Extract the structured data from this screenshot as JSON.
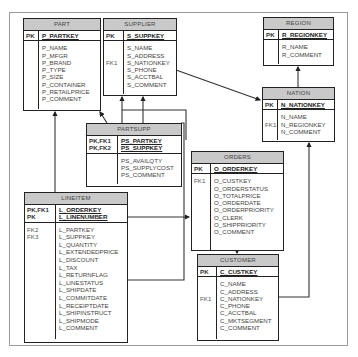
{
  "tables": {
    "part": {
      "title": "PART",
      "pk_labels": [
        "PK"
      ],
      "pk_fields": [
        "P_PARTKEY"
      ],
      "fk_labels": [],
      "fields": [
        "P_NAME",
        "P_MFGR",
        "P_BRAND",
        "P_TYPE",
        "P_SIZE",
        "P_CONTAINER",
        "P_RETAILPRICE",
        "P_COMMENT"
      ]
    },
    "supplier": {
      "title": "SUPPLIER",
      "pk_labels": [
        "PK"
      ],
      "pk_fields": [
        "S_SUPPKEY"
      ],
      "fk_labels": [
        "",
        "",
        "FK1"
      ],
      "fields": [
        "S_NAME",
        "S_ADDRESS",
        "S_NATIONKEY",
        "S_PHONE",
        "S_ACCTBAL",
        "S_COMMENT"
      ]
    },
    "region": {
      "title": "REGION",
      "pk_labels": [
        "PK"
      ],
      "pk_fields": [
        "R_REGIONKEY"
      ],
      "fk_labels": [],
      "fields": [
        "R_NAME",
        "R_COMMENT"
      ]
    },
    "nation": {
      "title": "NATION",
      "pk_labels": [
        "PK"
      ],
      "pk_fields": [
        "N_NATIONKEY"
      ],
      "fk_labels": [
        "",
        "FK1"
      ],
      "fields": [
        "N_NAME",
        "N_REGIONKEY",
        "N_COMMENT"
      ]
    },
    "partsupp": {
      "title": "PARTSUPP",
      "pk_labels": [
        "PK,FK1",
        "PK,FK2"
      ],
      "pk_fields": [
        "PS_PARTKEY",
        "PS_SUPPKEY"
      ],
      "fk_labels": [],
      "fields": [
        "PS_AVAILQTY",
        "PS_SUPPLYCOST",
        "PS_COMMENT"
      ]
    },
    "orders": {
      "title": "ORDERS",
      "pk_labels": [
        "PK"
      ],
      "pk_fields": [
        "O_ORDERKEY"
      ],
      "fk_labels": [
        "FK1"
      ],
      "fields": [
        "O_CUSTKEY",
        "O_ORDERSTATUS",
        "O_TOTALPRICE",
        "O_ORDERDATE",
        "O_ORDERPRIORITY",
        "O_CLERK",
        "O_SHIPPRIORITY",
        "O_COMMENT"
      ]
    },
    "lineitem": {
      "title": "LINEITEM",
      "pk_labels": [
        "PK,FK1",
        "PK"
      ],
      "pk_fields": [
        "L_ORDERKEY",
        "L_LINENUMBER"
      ],
      "fk_labels": [
        "FK2",
        "FK3"
      ],
      "fields": [
        "L_PARTKEY",
        "L_SUPPKEY",
        "L_QUANTITY",
        "L_EXTENDEDPRICE",
        "L_DISCOUNT",
        "L_TAX",
        "L_RETURNFLAG",
        "L_LINESTATUS",
        "L_SHIPDATE",
        "L_COMMITDATE",
        "L_RECEIPTDATE",
        "L_SHIPINSTRUCT",
        "L_SHIPMODE",
        "L_COMMENT"
      ]
    },
    "customer": {
      "title": "CUSTOMER",
      "pk_labels": [
        "PK"
      ],
      "pk_fields": [
        "C_CUSTKEY"
      ],
      "fk_labels": [
        "",
        "",
        "FK1"
      ],
      "fields": [
        "C_NAME",
        "C_ADDRESS",
        "C_NATIONKEY",
        "C_PHONE",
        "C_ACCTBAL",
        "C_MKTSEGMENT",
        "C_COMMENT"
      ]
    }
  },
  "colors": {
    "header": "#c9c9c9",
    "border": "#222222",
    "frame": "#9a9a9a"
  }
}
